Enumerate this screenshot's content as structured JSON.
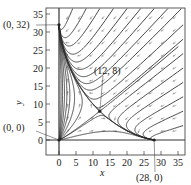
{
  "chart_data": {
    "type": "phase-portrait",
    "title": "",
    "xlabel": "x",
    "ylabel": "y",
    "xlim": [
      -4,
      37
    ],
    "ylim": [
      -4,
      37
    ],
    "xticks": [
      0,
      5,
      10,
      15,
      20,
      25,
      30,
      35
    ],
    "yticks": [
      0,
      5,
      10,
      15,
      20,
      25,
      30,
      35
    ],
    "grid": false,
    "equilibria": [
      {
        "label": "(0, 0)",
        "x": 0,
        "y": 0,
        "type": "unstable node"
      },
      {
        "label": "(0, 32)",
        "x": 0,
        "y": 32,
        "type": "stable node"
      },
      {
        "label": "(12, 8)",
        "x": 12,
        "y": 8,
        "type": "saddle"
      },
      {
        "label": "(28, 0)",
        "x": 28,
        "y": 0,
        "type": "stable node"
      }
    ],
    "direction_field": "arrows point down-left in the upper-right region"
  }
}
